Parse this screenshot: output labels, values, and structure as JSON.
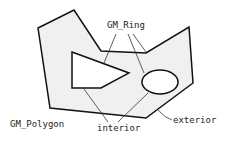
{
  "diagram": {
    "labels": {
      "ring": "GM_Ring",
      "polygon": "GM_Polygon",
      "interior": "interior",
      "exterior": "exterior"
    },
    "colors": {
      "fill": "#f0f0f0",
      "stroke": "#111111",
      "leader": "#333333",
      "hole": "#ffffff"
    }
  }
}
